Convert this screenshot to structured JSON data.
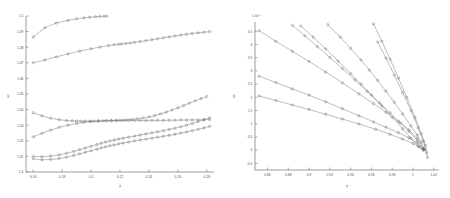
{
  "figure": {
    "title": "",
    "background": "#ffffff",
    "line_color": "#6e6e6e",
    "marker_color": "#5f5f5f",
    "axis_color": "#5a5a5a"
  },
  "chart_data": [
    {
      "type": "line",
      "panel": "left",
      "title": "",
      "xlabel": "T",
      "ylabel": "ω",
      "xlim": [
        0.155,
        0.285
      ],
      "ylim": [
        1.4,
        1.5
      ],
      "xticks": [
        0.16,
        0.18,
        0.2,
        0.22,
        0.24,
        0.26,
        0.28
      ],
      "xticklabels": [
        "0.16",
        "0.18",
        "0.2",
        "0.22",
        "0.24",
        "0.26",
        "0.28"
      ],
      "yticks": [
        1.4,
        1.41,
        1.42,
        1.43,
        1.44,
        1.45,
        1.46,
        1.47,
        1.48,
        1.49,
        1.5
      ],
      "yticklabels": [
        "1.4",
        "1.41",
        "1.42",
        "1.43",
        "1.44",
        "1.45",
        "1.46",
        "1.47",
        "1.48",
        "1.49",
        "1.5"
      ],
      "grid": false,
      "legend": "none",
      "marker": "circle",
      "series": [
        {
          "name": "branch-1-upper-short",
          "x": [
            0.16,
            0.168,
            0.176,
            0.184,
            0.19,
            0.195,
            0.199,
            0.203,
            0.206,
            0.209,
            0.211
          ],
          "y": [
            1.4865,
            1.4925,
            1.4955,
            1.4972,
            1.4982,
            1.4988,
            1.4992,
            1.4995,
            1.4997,
            1.4998,
            1.4999
          ]
        },
        {
          "name": "branch-2-rising",
          "x": [
            0.16,
            0.168,
            0.176,
            0.184,
            0.192,
            0.2,
            0.206,
            0.212,
            0.216,
            0.219,
            0.221,
            0.224,
            0.227,
            0.23,
            0.234,
            0.238,
            0.242,
            0.246,
            0.25,
            0.254,
            0.258,
            0.262,
            0.266,
            0.27,
            0.274,
            0.278,
            0.282
          ],
          "y": [
            1.47,
            1.4718,
            1.4738,
            1.4757,
            1.4775,
            1.479,
            1.48,
            1.481,
            1.4816,
            1.4819,
            1.4821,
            1.4824,
            1.4827,
            1.4831,
            1.4836,
            1.4842,
            1.4848,
            1.4854,
            1.486,
            1.4866,
            1.4872,
            1.4878,
            1.4883,
            1.4888,
            1.4892,
            1.4896,
            1.49
          ]
        },
        {
          "name": "branch-3-minimum",
          "x": [
            0.16,
            0.166,
            0.172,
            0.178,
            0.183,
            0.187,
            0.19,
            0.193,
            0.196,
            0.199,
            0.202,
            0.205,
            0.208,
            0.211,
            0.214,
            0.217,
            0.22,
            0.224,
            0.228,
            0.232,
            0.236,
            0.24,
            0.244,
            0.248,
            0.252,
            0.256,
            0.26,
            0.264,
            0.268,
            0.272,
            0.276,
            0.28
          ],
          "y": [
            1.438,
            1.436,
            1.4345,
            1.4335,
            1.433,
            1.4328,
            1.4327,
            1.4326,
            1.4326,
            1.4326,
            1.4326,
            1.4327,
            1.4328,
            1.4329,
            1.433,
            1.4331,
            1.4332,
            1.4334,
            1.4337,
            1.4341,
            1.4346,
            1.4353,
            1.4362,
            1.4372,
            1.4384,
            1.4397,
            1.4411,
            1.4426,
            1.4441,
            1.4456,
            1.447,
            1.4484
          ]
        },
        {
          "name": "branch-4-flat",
          "x": [
            0.16,
            0.166,
            0.172,
            0.178,
            0.184,
            0.19,
            0.195,
            0.2,
            0.205,
            0.21,
            0.214,
            0.218,
            0.222,
            0.226,
            0.23,
            0.234,
            0.238,
            0.242,
            0.246,
            0.25,
            0.254,
            0.258,
            0.262,
            0.266,
            0.27,
            0.274,
            0.278,
            0.282
          ],
          "y": [
            1.4225,
            1.4248,
            1.4268,
            1.4286,
            1.43,
            1.4311,
            1.4318,
            1.4323,
            1.4326,
            1.4328,
            1.4329,
            1.4329,
            1.433,
            1.433,
            1.433,
            1.433,
            1.433,
            1.4331,
            1.4331,
            1.4331,
            1.4332,
            1.4332,
            1.4333,
            1.4333,
            1.4334,
            1.4334,
            1.4335,
            1.4336
          ]
        },
        {
          "name": "branch-5-lower-a",
          "x": [
            0.16,
            0.166,
            0.172,
            0.178,
            0.183,
            0.188,
            0.192,
            0.196,
            0.2,
            0.204,
            0.207,
            0.21,
            0.213,
            0.216,
            0.219,
            0.222,
            0.226,
            0.23,
            0.234,
            0.238,
            0.242,
            0.246,
            0.25,
            0.254,
            0.258,
            0.262,
            0.266,
            0.27,
            0.274,
            0.278,
            0.282
          ],
          "y": [
            1.41,
            1.4098,
            1.4102,
            1.411,
            1.412,
            1.4132,
            1.4143,
            1.4154,
            1.4165,
            1.4176,
            1.4184,
            1.4192,
            1.4199,
            1.4205,
            1.4211,
            1.4216,
            1.4223,
            1.423,
            1.4237,
            1.4244,
            1.4251,
            1.4258,
            1.4265,
            1.4273,
            1.4281,
            1.429,
            1.43,
            1.4311,
            1.4323,
            1.4335,
            1.4348
          ]
        },
        {
          "name": "branch-6-lower-b",
          "x": [
            0.16,
            0.166,
            0.172,
            0.178,
            0.183,
            0.188,
            0.192,
            0.196,
            0.2,
            0.204,
            0.207,
            0.21,
            0.213,
            0.216,
            0.219,
            0.222,
            0.226,
            0.23,
            0.234,
            0.238,
            0.242,
            0.246,
            0.25,
            0.254,
            0.258,
            0.262,
            0.266,
            0.27,
            0.274,
            0.278,
            0.282
          ],
          "y": [
            1.4085,
            1.4078,
            1.408,
            1.4086,
            1.4095,
            1.4106,
            1.4116,
            1.4126,
            1.4136,
            1.4146,
            1.4154,
            1.4161,
            1.4168,
            1.4174,
            1.418,
            1.4185,
            1.4192,
            1.4199,
            1.4205,
            1.4211,
            1.4217,
            1.4223,
            1.4229,
            1.4235,
            1.4242,
            1.4249,
            1.4257,
            1.4265,
            1.4274,
            1.4283,
            1.4293
          ]
        }
      ]
    },
    {
      "type": "line",
      "panel": "right",
      "title": "",
      "xlabel": "T",
      "ylabel": "ω",
      "y_exponent": "x 10",
      "y_exponent_power": "-3",
      "xlim": [
        0.848,
        1.025
      ],
      "ylim": [
        -0.75,
        4.85
      ],
      "xticks": [
        0.86,
        0.88,
        0.9,
        0.92,
        0.94,
        0.96,
        0.98,
        1.0,
        1.02
      ],
      "xticklabels": [
        "0.86",
        "0.88",
        "0.9",
        "0.92",
        "0.94",
        "0.96",
        "0.98",
        "1",
        "1.02"
      ],
      "yticks": [
        -0.5,
        0,
        0.5,
        1,
        1.5,
        2,
        2.5,
        3,
        3.5,
        4,
        4.5
      ],
      "yticklabels": [
        "-0.5",
        "0",
        "0.5",
        "1",
        "1.5",
        "2",
        "2.5",
        "3",
        "3.5",
        "4",
        "4.5"
      ],
      "grid": false,
      "legend": "none",
      "marker": "circle",
      "series": [
        {
          "name": "line-1-shallow",
          "x": [
            0.852,
            0.868,
            0.884,
            0.9,
            0.916,
            0.932,
            0.948,
            0.964,
            0.978,
            0.99,
            1.0,
            1.006,
            1.01
          ],
          "y": [
            2.05,
            1.88,
            1.71,
            1.54,
            1.36,
            1.18,
            0.99,
            0.79,
            0.6,
            0.42,
            0.25,
            0.12,
            0.02
          ]
        },
        {
          "name": "line-2",
          "x": [
            0.852,
            0.868,
            0.884,
            0.9,
            0.916,
            0.932,
            0.948,
            0.962,
            0.974,
            0.986,
            0.996,
            1.004,
            1.01
          ],
          "y": [
            2.8,
            2.56,
            2.32,
            2.08,
            1.83,
            1.57,
            1.3,
            1.07,
            0.87,
            0.66,
            0.47,
            0.27,
            0.05
          ]
        },
        {
          "name": "line-3",
          "x": [
            0.852,
            0.868,
            0.884,
            0.9,
            0.916,
            0.932,
            0.948,
            0.962,
            0.974,
            0.986,
            0.996,
            1.004,
            1.01
          ],
          "y": [
            4.52,
            4.12,
            3.74,
            3.36,
            2.96,
            2.55,
            2.13,
            1.76,
            1.43,
            1.09,
            0.77,
            0.44,
            0.06
          ]
        },
        {
          "name": "line-4",
          "x": [
            0.884,
            0.896,
            0.908,
            0.92,
            0.932,
            0.944,
            0.956,
            0.968,
            0.978,
            0.988,
            0.996,
            1.004,
            1.01
          ],
          "y": [
            4.72,
            4.33,
            3.92,
            3.51,
            3.09,
            2.66,
            2.22,
            1.78,
            1.41,
            1.03,
            0.71,
            0.37,
            0.02
          ]
        },
        {
          "name": "line-5",
          "x": [
            0.892,
            0.904,
            0.916,
            0.928,
            0.94,
            0.95,
            0.96,
            0.97,
            0.98,
            0.99,
            0.998,
            1.005,
            1.01
          ],
          "y": [
            4.7,
            4.28,
            3.83,
            3.37,
            2.9,
            2.5,
            2.09,
            1.67,
            1.24,
            0.81,
            0.45,
            0.15,
            0.0
          ]
        },
        {
          "name": "line-6",
          "x": [
            0.918,
            0.93,
            0.94,
            0.95,
            0.958,
            0.966,
            0.974,
            0.982,
            0.99,
            0.998,
            1.004,
            1.008,
            1.011
          ],
          "y": [
            4.75,
            4.28,
            3.85,
            3.41,
            3.03,
            2.64,
            2.23,
            1.81,
            1.37,
            0.92,
            0.57,
            0.3,
            0.02
          ]
        },
        {
          "name": "line-7-steep",
          "x": [
            0.962,
            0.97,
            0.978,
            0.986,
            0.994,
            1.002,
            1.008,
            1.012,
            1.014
          ],
          "y": [
            4.78,
            4.12,
            3.44,
            2.73,
            2.0,
            1.24,
            0.62,
            0.18,
            -0.28
          ]
        },
        {
          "name": "line-8-steep-b",
          "x": [
            0.966,
            0.974,
            0.982,
            0.99,
            0.998,
            1.005,
            1.01,
            1.013
          ],
          "y": [
            4.1,
            3.48,
            2.84,
            2.18,
            1.5,
            0.85,
            0.35,
            -0.1
          ]
        }
      ]
    }
  ]
}
